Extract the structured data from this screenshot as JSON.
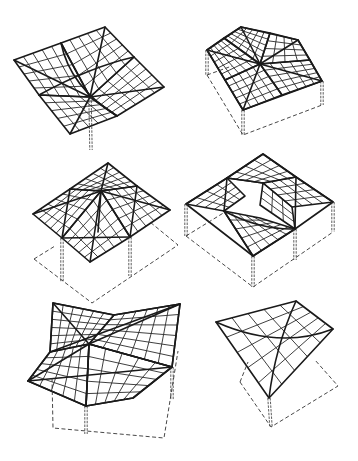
{
  "figure": {
    "stroke_color": "#1a1a1a",
    "background_color": "#ffffff",
    "panels": [
      {
        "id": "shell-1",
        "label": "Inverted umbrella on single central column",
        "supports": 1
      },
      {
        "id": "shell-2",
        "label": "Four-quadrant hip roof on walls",
        "supports": 3
      },
      {
        "id": "shell-3",
        "label": "Pyramidal four-quadrant roof on two columns",
        "supports": 2
      },
      {
        "id": "shell-4",
        "label": "Folded double-ridge roof on walls and columns",
        "supports": 4
      },
      {
        "id": "shell-5",
        "label": "Tilted four-quadrant roof on column",
        "supports": 2
      },
      {
        "id": "shell-6",
        "label": "Single saddle roof on one corner column",
        "supports": 1
      }
    ]
  }
}
